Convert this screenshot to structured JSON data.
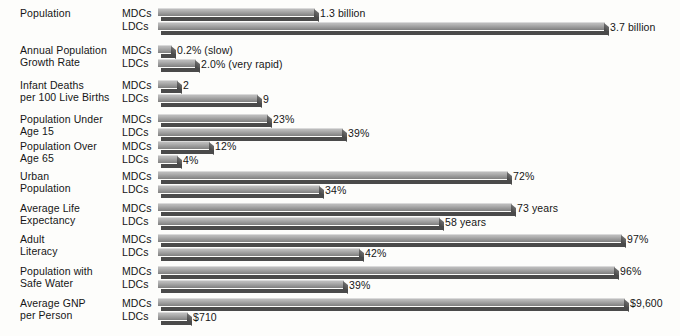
{
  "chart_data": {
    "type": "bar",
    "title": "",
    "subtitle": "",
    "xlabel": "",
    "ylabel": "",
    "grid": false,
    "legend_position": "inline-row-labels",
    "orientation": "horizontal",
    "style": "3d-bars",
    "group_labels": [
      "MDCs",
      "LDCs"
    ],
    "categories": [
      "Population",
      "Annual Population Growth Rate",
      "Infant Deaths per 100 Live Births",
      "Population Under Age 15",
      "Population Over Age 65",
      "Urban Population",
      "Average Life Expectancy",
      "Adult Literacy",
      "Population with Safe Water",
      "Average GNP per Person"
    ],
    "series": [
      {
        "name": "MDCs",
        "values": [
          1.3,
          0.2,
          2,
          23,
          12,
          72,
          73,
          97,
          96,
          9600
        ],
        "labels": [
          "1.3 billion",
          "0.2% (slow)",
          "2",
          "23%",
          "12%",
          "72%",
          "73 years",
          "97%",
          "96%",
          "$9,600"
        ]
      },
      {
        "name": "LDCs",
        "values": [
          3.7,
          2.0,
          9,
          39,
          4,
          34,
          58,
          42,
          39,
          710
        ],
        "labels": [
          "3.7 billion",
          "2.0% (very rapid)",
          "9",
          "39%",
          "4%",
          "34%",
          "58 years",
          "42%",
          "39%",
          "$710"
        ]
      }
    ]
  },
  "rows": [
    {
      "label_lines": [
        "Population"
      ],
      "top": 8,
      "mdc": {
        "group": "MDCs",
        "label": "1.3 billion",
        "width": 157,
        "value_x": 320
      },
      "ldc": {
        "group": "LDCs",
        "label": "3.7 billion",
        "width": 447,
        "value_x": 610
      }
    },
    {
      "label_lines": [
        "Annual Population",
        "Growth Rate"
      ],
      "top": 45,
      "mdc": {
        "group": "MDCs",
        "label": "0.2% (slow)",
        "width": 14,
        "value_x": 177
      },
      "ldc": {
        "group": "LDCs",
        "label": "2.0% (very rapid)",
        "width": 38,
        "value_x": 201
      }
    },
    {
      "label_lines": [
        "Infant Deaths",
        "per 100 Live Births"
      ],
      "top": 80,
      "mdc": {
        "group": "MDCs",
        "label": "2",
        "width": 20,
        "value_x": 183
      },
      "ldc": {
        "group": "LDCs",
        "label": "9",
        "width": 100,
        "value_x": 263
      }
    },
    {
      "label_lines": [
        "Population Under",
        "Age 15"
      ],
      "top": 114,
      "mdc": {
        "group": "MDCs",
        "label": "23%",
        "width": 110,
        "value_x": 273
      },
      "ldc": {
        "group": "LDCs",
        "label": "39%",
        "width": 185,
        "value_x": 348
      }
    },
    {
      "label_lines": [
        "Population Over",
        "Age 65"
      ],
      "top": 141,
      "mdc": {
        "group": "MDCs",
        "label": "12%",
        "width": 52,
        "value_x": 215
      },
      "ldc": {
        "group": "LDCs",
        "label": "4%",
        "width": 20,
        "value_x": 183
      }
    },
    {
      "label_lines": [
        "Urban",
        "Population"
      ],
      "top": 171,
      "mdc": {
        "group": "MDCs",
        "label": "72%",
        "width": 350,
        "value_x": 513
      },
      "ldc": {
        "group": "LDCs",
        "label": "34%",
        "width": 162,
        "value_x": 325
      }
    },
    {
      "label_lines": [
        "Average Life",
        "Expectancy"
      ],
      "top": 203,
      "mdc": {
        "group": "MDCs",
        "label": "73 years",
        "width": 354,
        "value_x": 517
      },
      "ldc": {
        "group": "LDCs",
        "label": "58 years",
        "width": 282,
        "value_x": 445
      }
    },
    {
      "label_lines": [
        "Adult",
        "Literacy"
      ],
      "top": 234,
      "mdc": {
        "group": "MDCs",
        "label": "97%",
        "width": 464,
        "value_x": 627
      },
      "ldc": {
        "group": "LDCs",
        "label": "42%",
        "width": 202,
        "value_x": 365
      }
    },
    {
      "label_lines": [
        "Population with",
        "Safe Water"
      ],
      "top": 266,
      "mdc": {
        "group": "MDCs",
        "label": "96%",
        "width": 457,
        "value_x": 620
      },
      "ldc": {
        "group": "LDCs",
        "label": "39%",
        "width": 186,
        "value_x": 349
      }
    },
    {
      "label_lines": [
        "Average GNP",
        "per Person"
      ],
      "top": 298,
      "mdc": {
        "group": "MDCs",
        "label": "$9,600",
        "width": 467,
        "value_x": 630
      },
      "ldc": {
        "group": "LDCs",
        "label": "$710",
        "width": 30,
        "value_x": 193
      }
    }
  ],
  "colors": {
    "bar_top": "#b3b3b3",
    "bar_front": "#4a4a4a",
    "bar_highlight": "#dadada",
    "text": "#161616",
    "background": "#fdfdfb"
  }
}
